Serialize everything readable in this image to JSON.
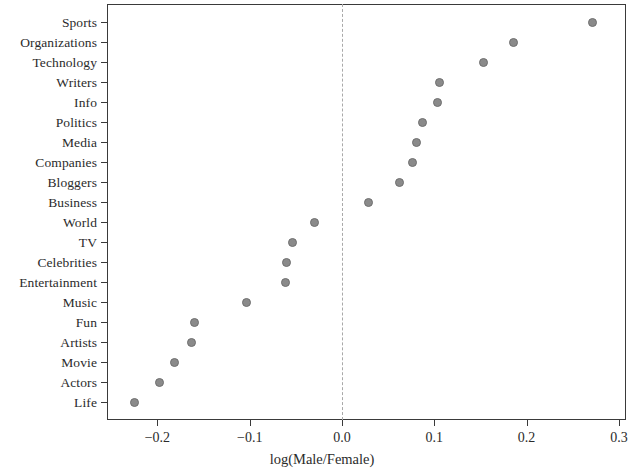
{
  "chart_data": {
    "type": "scatter",
    "title": "",
    "subtitle": "",
    "xlabel": "log(Male/Female)",
    "ylabel": "",
    "xlim": [
      -0.25,
      0.3
    ],
    "ylim": [
      0,
      21
    ],
    "grid": false,
    "legend": null,
    "orientation": "horizontal-dot-plot",
    "reference_line": {
      "value": 0.0,
      "style": "dashed",
      "color": "#a9a9a9"
    },
    "marker": {
      "shape": "circle",
      "color": "#8a8a8a",
      "edge_color": "#6f6f6f",
      "size": 9
    },
    "xticks": [
      "-0.2",
      "-0.1",
      "0.0",
      "0.1",
      "0.2",
      "0.3"
    ],
    "xtick_values": [
      -0.2,
      -0.1,
      0.0,
      0.1,
      0.2,
      0.3
    ],
    "categories": [
      "Sports",
      "Organizations",
      "Technology",
      "Writers",
      "Info",
      "Politics",
      "Media",
      "Companies",
      "Bloggers",
      "Business",
      "World",
      "TV",
      "Celebrities",
      "Entertainment",
      "Music",
      "Fun",
      "Artists",
      "Movie",
      "Actors",
      "Life"
    ],
    "values": [
      0.271,
      0.186,
      0.153,
      0.106,
      0.103,
      0.087,
      0.081,
      0.076,
      0.062,
      0.029,
      -0.03,
      -0.054,
      -0.06,
      -0.061,
      -0.103,
      -0.16,
      -0.163,
      -0.181,
      -0.198,
      -0.225
    ]
  }
}
